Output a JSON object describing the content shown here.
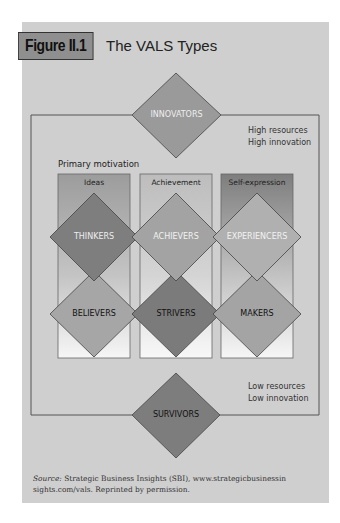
{
  "figure": {
    "label": "Figure II.1",
    "title": "The VALS Types"
  },
  "top_annotation": {
    "line1": "High resources",
    "line2": "High innovation"
  },
  "bottom_annotation": {
    "line1": "Low resources",
    "line2": "Low innovation"
  },
  "primary_motivation_label": "Primary motivation",
  "columns": [
    {
      "header": "Ideas",
      "upper": "THINKERS",
      "lower": "BELIEVERS"
    },
    {
      "header": "Achievement",
      "upper": "ACHIEVERS",
      "lower": "STRIVERS"
    },
    {
      "header": "Self-expression",
      "upper": "EXPERIENCERS",
      "lower": "MAKERS"
    }
  ],
  "top_type": "INNOVATORS",
  "bottom_type": "SURVIVORS",
  "source": {
    "prefix": "Source:",
    "text": " Strategic Business Insights (SBI), www.strategicbusinessin sights.com/vals. Reprinted by permission."
  },
  "colors": {
    "panel": "#cfcfcf",
    "innovators": "#9a9a9a",
    "survivors": "#7d7d7d",
    "thinkers": "#7e7e7e",
    "achievers": "#a3a3a3",
    "experiencers": "#b0b0b0",
    "believers": "#a6a6a6",
    "strivers": "#7b7b7b",
    "makers": "#a4a4a4"
  }
}
